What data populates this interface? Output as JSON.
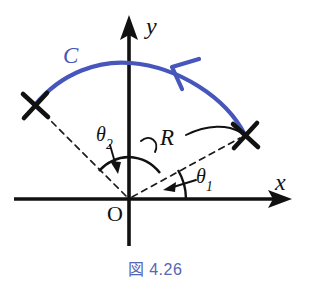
{
  "figure": {
    "caption": "図 4.26",
    "caption_color": "#5566b5",
    "curve_color": "#4656bb",
    "ink_color": "#111111",
    "background": "#ffffff"
  },
  "axes": {
    "x_label": "x",
    "y_label": "y",
    "origin_label": "O",
    "origin_px": {
      "x": 129,
      "y": 199
    },
    "x_axis": {
      "from_x": 14,
      "to_x": 292,
      "y": 199,
      "arrow": "right"
    },
    "y_axis": {
      "x": 129,
      "from_y": 246,
      "to_y": 16,
      "arrow": "up"
    }
  },
  "labels": {
    "curve": "C",
    "radius": "R",
    "theta1_base": "θ",
    "theta1_sub": "1",
    "theta2_base": "θ",
    "theta2_sub": "2"
  },
  "markers": [
    {
      "name": "endpoint-left",
      "x": 35,
      "y": 105,
      "glyph": "cross"
    },
    {
      "name": "endpoint-right",
      "x": 245,
      "y": 135,
      "glyph": "cross"
    }
  ],
  "curve": {
    "name": "C",
    "start_px": {
      "x": 35,
      "y": 105
    },
    "apex_px": {
      "x": 130,
      "y": 63
    },
    "end_px": {
      "x": 245,
      "y": 135
    },
    "direction": "clockwise-to-counterclockwise-arrowhead-points-left",
    "arrowhead_px": {
      "x": 176,
      "y": 66
    }
  },
  "radii": [
    {
      "name": "radius-to-left-endpoint",
      "style": "dashed",
      "from": {
        "x": 129,
        "y": 199
      },
      "to": {
        "x": 35,
        "y": 105
      }
    },
    {
      "name": "radius-to-right-endpoint",
      "style": "dashed",
      "from": {
        "x": 129,
        "y": 199
      },
      "to": {
        "x": 245,
        "y": 135
      }
    }
  ],
  "angle_arcs": [
    {
      "name": "theta2-arc",
      "radius_px": 42,
      "from_deg": 90,
      "to_deg": 135
    },
    {
      "name": "theta1-arc",
      "radius_px": 57,
      "from_deg": 0,
      "to_deg": 30
    }
  ],
  "annotations": {
    "theta1_arrow": {
      "from": {
        "x": 193,
        "y": 180
      },
      "to": {
        "x": 166,
        "y": 188
      }
    },
    "theta2_arrow": {
      "from": {
        "x": 110,
        "y": 146
      },
      "to": {
        "x": 116,
        "y": 172
      }
    },
    "radius_leader": {
      "from": {
        "x": 157,
        "y": 150
      },
      "to": {
        "x": 240,
        "y": 133
      }
    }
  }
}
